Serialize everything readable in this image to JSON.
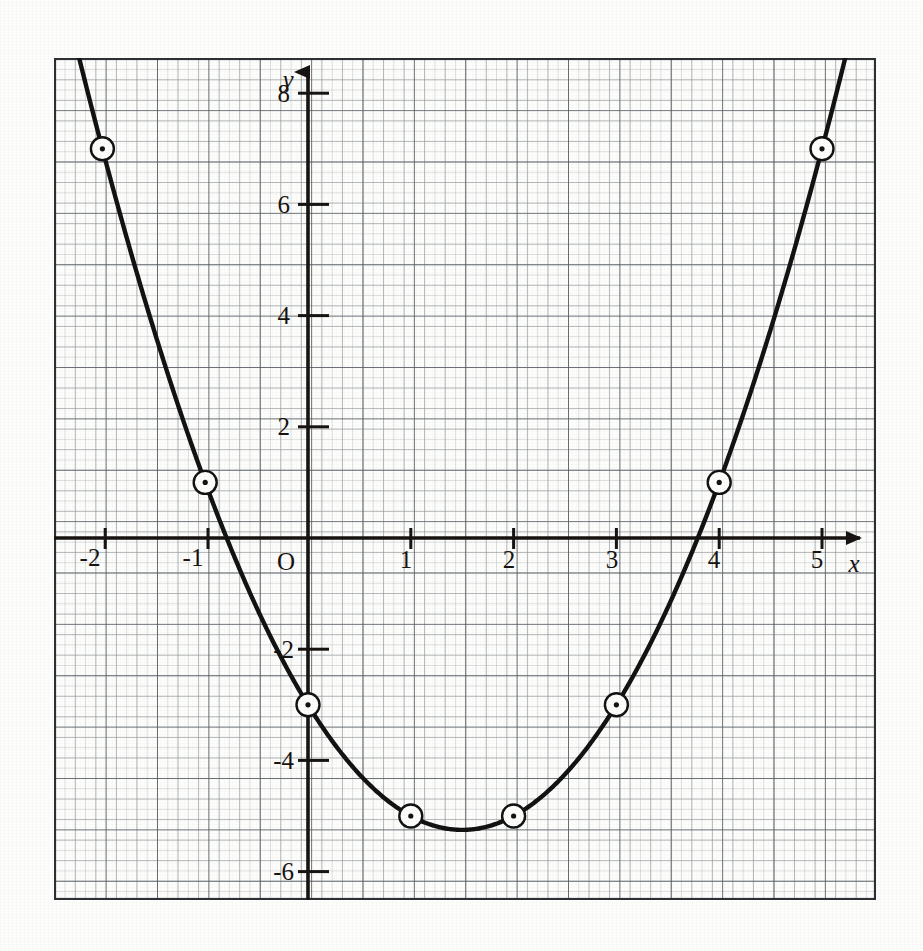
{
  "figure": {
    "kind": "graph-paper-plot",
    "background_color": "#fdfdfc",
    "ink_color": "#15120f",
    "grid": {
      "fine_color": "#b9bdc0",
      "medium_color": "#8f969b",
      "heavy_color": "#4e545a",
      "frame_color": "#2b2f33",
      "fine_spacing_px": 10.3,
      "heavy_every_n_fine": 5
    },
    "axes": {
      "origin_label": "O",
      "x_axis_name": "x",
      "y_axis_name": "y",
      "x_arrow": true,
      "y_arrow": true,
      "x_tick_labels": [
        "-2",
        "-1",
        "1",
        "2",
        "3",
        "4",
        "5"
      ],
      "y_tick_labels": [
        "8",
        "6",
        "4",
        "2",
        "-2",
        "-4",
        "-6"
      ]
    },
    "curve": {
      "stroke_color": "#111111",
      "stroke_width_px": 4.4,
      "marker": "circled-dot"
    }
  },
  "chart_data": {
    "type": "line",
    "title": "",
    "subtitle": "",
    "xlabel": "x",
    "ylabel": "y",
    "grid": true,
    "legend": "none",
    "equation": "y = x^2 - 3x - 3",
    "xlim": [
      -2.45,
      5.5
    ],
    "ylim": [
      -6.95,
      9.3
    ],
    "xticks": [
      -2,
      -1,
      0,
      1,
      2,
      3,
      4,
      5
    ],
    "xticklabels": [
      "-2",
      "-1",
      "O",
      "1",
      "2",
      "3",
      "4",
      "5"
    ],
    "yticks": [
      -6,
      -4,
      -2,
      2,
      4,
      6,
      8
    ],
    "yticklabels": [
      "-6",
      "-4",
      "-2",
      "2",
      "4",
      "6",
      "8"
    ],
    "x_minor_tick_step": 0.1,
    "y_minor_tick_step": 0.2,
    "series": [
      {
        "name": "y = x^2 - 3x - 3",
        "marked_points": true,
        "x": [
          -2,
          -1,
          0,
          1,
          2,
          3,
          4,
          5
        ],
        "values": [
          7,
          1,
          -3,
          -5,
          -5,
          -3,
          1,
          7
        ]
      }
    ],
    "vertex": {
      "x": 1.5,
      "y": -5.25
    },
    "roots_approx": [
      -0.79,
      3.79
    ],
    "y_intercept": -3,
    "annotations": []
  }
}
